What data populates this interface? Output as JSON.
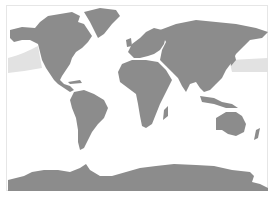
{
  "map": {
    "projection": "world-map",
    "colors": {
      "background": "#ffffff",
      "land": "#8c8c8c",
      "band": "#e2e2e2",
      "frame": "#e6e6e6"
    },
    "regions": [
      {
        "name": "north-america"
      },
      {
        "name": "greenland"
      },
      {
        "name": "south-america"
      },
      {
        "name": "europe"
      },
      {
        "name": "africa"
      },
      {
        "name": "asia"
      },
      {
        "name": "australia"
      },
      {
        "name": "antarctica"
      }
    ],
    "overlay": {
      "name": "pacific-band"
    }
  }
}
